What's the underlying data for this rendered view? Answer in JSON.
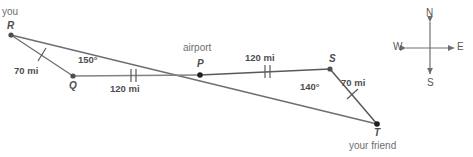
{
  "diagram": {
    "stroke_color": "#6d6e71",
    "point_color": "#4d4e50",
    "text_color": "#58595b",
    "points": {
      "R": {
        "label": "R",
        "x": 11,
        "y": 35,
        "caption": "you"
      },
      "Q": {
        "label": "Q",
        "x": 73,
        "y": 76,
        "caption": ""
      },
      "P": {
        "label": "P",
        "x": 200,
        "y": 75,
        "caption": "airport"
      },
      "S": {
        "label": "S",
        "x": 330,
        "y": 69,
        "caption": ""
      },
      "T": {
        "label": "T",
        "x": 377,
        "y": 124,
        "caption": "your friend"
      }
    },
    "segments": [
      {
        "name": "RQ",
        "from": "R",
        "to": "Q",
        "length_label": "70 mi",
        "ticks": 1
      },
      {
        "name": "QP",
        "from": "Q",
        "to": "P",
        "length_label": "120 mi",
        "ticks": 2
      },
      {
        "name": "PS",
        "from": "P",
        "to": "S",
        "length_label": "120 mi",
        "ticks": 2
      },
      {
        "name": "ST",
        "from": "S",
        "to": "T",
        "length_label": "70 mi",
        "ticks": 1
      },
      {
        "name": "RT",
        "from": "R",
        "to": "T",
        "length_label": "",
        "ticks": 0
      }
    ],
    "angles": [
      {
        "name": "angle-RQP",
        "vertex": "Q",
        "value": "150°"
      },
      {
        "name": "angle-PST",
        "vertex": "S",
        "value": "140°"
      }
    ],
    "labels": {
      "you": "you",
      "airport": "airport",
      "your_friend": "your friend",
      "dist_rq": "70 mi",
      "dist_qp": "120 mi",
      "dist_ps": "120 mi",
      "dist_st": "70 mi",
      "angle_q": "150°",
      "angle_s": "140°",
      "point_r": "R",
      "point_q": "Q",
      "point_p": "P",
      "point_s": "S",
      "point_t": "T"
    }
  },
  "compass": {
    "north": "N",
    "east": "E",
    "south": "S",
    "west": "W",
    "center_x": 430,
    "center_y": 48
  }
}
